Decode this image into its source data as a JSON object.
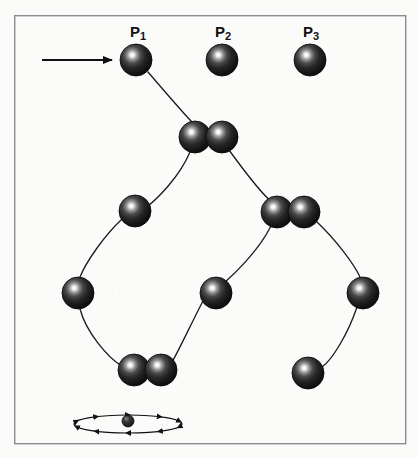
{
  "figure": {
    "type": "diagram",
    "background_color": "#fbfbfa",
    "frame": {
      "x": 14,
      "y": 15,
      "width": 391,
      "height": 428,
      "stroke_color": "#8c8c8c",
      "stroke_width": 1.4
    },
    "sphere_style": {
      "radius": 16,
      "base_color": "#1a1a1a",
      "mid_color": "#2e2e2e",
      "highlight_color": "#f2f2f2",
      "outline_color": "#000000"
    },
    "bond_style": {
      "stroke_color": "#1a1a1a",
      "stroke_width": 1.3
    },
    "arrow": {
      "label": "incoming-direction-arrow",
      "x1": 42,
      "y1": 60,
      "x2": 113,
      "y2": 60,
      "stroke_color": "#111111",
      "stroke_width": 2.2,
      "head_length": 13,
      "head_width": 9
    },
    "labels": [
      {
        "id": "p1",
        "text": "P",
        "sub": "1",
        "x": 130,
        "y": 24
      },
      {
        "id": "p2",
        "text": "P",
        "sub": "2",
        "x": 215,
        "y": 24
      },
      {
        "id": "p3",
        "text": "P",
        "sub": "3",
        "x": 303,
        "y": 24
      }
    ],
    "spheres": [
      {
        "id": "p1-sphere",
        "cx": 136,
        "cy": 60,
        "r": 16
      },
      {
        "id": "p2-sphere",
        "cx": 222,
        "cy": 60,
        "r": 16
      },
      {
        "id": "p3-sphere",
        "cx": 310,
        "cy": 60,
        "r": 16
      },
      {
        "id": "pair-top-left",
        "cx": 195,
        "cy": 137,
        "r": 16
      },
      {
        "id": "pair-top-right",
        "cx": 222,
        "cy": 137,
        "r": 16
      },
      {
        "id": "mid-left",
        "cx": 135,
        "cy": 211,
        "r": 16
      },
      {
        "id": "pair-right-left",
        "cx": 277,
        "cy": 212,
        "r": 16
      },
      {
        "id": "pair-right-right",
        "cx": 304,
        "cy": 212,
        "r": 16
      },
      {
        "id": "far-left",
        "cx": 78,
        "cy": 293,
        "r": 16
      },
      {
        "id": "center",
        "cx": 216,
        "cy": 293,
        "r": 16
      },
      {
        "id": "far-right",
        "cx": 363,
        "cy": 293,
        "r": 16
      },
      {
        "id": "pair-bot-left",
        "cx": 134,
        "cy": 370,
        "r": 16
      },
      {
        "id": "pair-bot-right",
        "cx": 161,
        "cy": 370,
        "r": 16
      },
      {
        "id": "bot-right",
        "cx": 308,
        "cy": 373,
        "r": 16
      }
    ],
    "bonds": [
      {
        "id": "bond-p1-to-pairtop",
        "d": "M 148 72 C 172 100 186 116 192 122"
      },
      {
        "id": "bond-pairtop-to-midleft",
        "d": "M 190 152 C 180 176 158 198 148 206"
      },
      {
        "id": "bond-midleft-to-farleft",
        "d": "M 122 219 C 104 236 86 262 80 277"
      },
      {
        "id": "bond-farleft-to-pairbot",
        "d": "M 80 309 C 86 332 108 358 122 366"
      },
      {
        "id": "bond-pairtop-to-pairright",
        "d": "M 229 150 C 245 172 264 196 272 202"
      },
      {
        "id": "bond-pairright-to-center",
        "d": "M 271 226 C 258 252 232 276 224 283"
      },
      {
        "id": "bond-center-to-pairbot",
        "d": "M 203 301 C 192 322 178 352 172 362"
      },
      {
        "id": "bond-pairright-to-farright",
        "d": "M 317 222 C 336 240 354 264 360 277"
      },
      {
        "id": "bond-farright-to-botright",
        "d": "M 357 307 C 348 334 332 360 322 367"
      }
    ],
    "orbit_symbol": {
      "id": "orbit-legend",
      "cx": 128,
      "cy": 424,
      "rx": 54,
      "ry": 9,
      "stroke_color": "#111111",
      "stroke_width": 1.2,
      "nucleus": {
        "cx": 128,
        "cy": 421,
        "r": 6
      },
      "arrow_marks": 10
    }
  }
}
